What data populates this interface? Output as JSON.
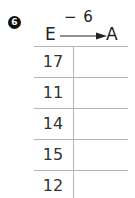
{
  "exercise": {
    "number": "6",
    "from_label": "E",
    "to_label": "A",
    "operation": "− 6",
    "inputs": [
      "17",
      "11",
      "14",
      "15",
      "12"
    ],
    "answers": [
      "",
      "",
      "",
      "",
      ""
    ]
  }
}
